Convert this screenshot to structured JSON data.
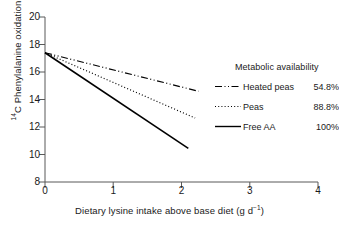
{
  "chart_data": {
    "type": "line",
    "title": "",
    "xlabel": "Dietary lysine intake above base diet (g d⁻¹)",
    "ylabel": "¹⁴C Phenylalanine oxidation (% of dose)",
    "xlim": [
      0,
      4
    ],
    "ylim": [
      8,
      20
    ],
    "xticks": [
      "0",
      "1",
      "2",
      "3",
      "4"
    ],
    "yticks": [
      "8",
      "10",
      "12",
      "14",
      "16",
      "18",
      "20"
    ],
    "grid": false,
    "legend_position": "right",
    "legend_title": "Metabolic availability",
    "series": [
      {
        "name": "Heated peas",
        "value_label": "54.8%",
        "style": "dash-dot",
        "x": [
          0,
          2.25
        ],
        "y": [
          17.4,
          14.6
        ],
        "slope": -1.24,
        "intercept": 17.4,
        "color": "#000000"
      },
      {
        "name": "Peas",
        "value_label": "88.8%",
        "style": "dotted",
        "x": [
          0,
          2.2
        ],
        "y": [
          17.4,
          12.65
        ],
        "slope": -2.16,
        "intercept": 17.4,
        "color": "#000000"
      },
      {
        "name": "Free AA",
        "value_label": "100%",
        "style": "solid",
        "x": [
          0,
          2.1
        ],
        "y": [
          17.4,
          10.45
        ],
        "slope": -3.31,
        "intercept": 17.4,
        "color": "#000000"
      }
    ]
  },
  "axes": {
    "ylabel_pre": "C Phenylalanine oxidation (% of dose)",
    "ylabel_sup": "14",
    "xlabel_pre": "Dietary lysine intake above base diet (g d",
    "xlabel_sup": "−1",
    "xlabel_post": ")"
  },
  "legend": {
    "title": "Metabolic availability",
    "rows": [
      {
        "name": "Heated peas",
        "value": "54.8%"
      },
      {
        "name": "Peas",
        "value": "88.8%"
      },
      {
        "name": "Free AA",
        "value": "100%"
      }
    ]
  },
  "colors": {
    "axis": "#595959",
    "line": "#000000",
    "text": "#1a1a1a",
    "background": "#ffffff"
  }
}
